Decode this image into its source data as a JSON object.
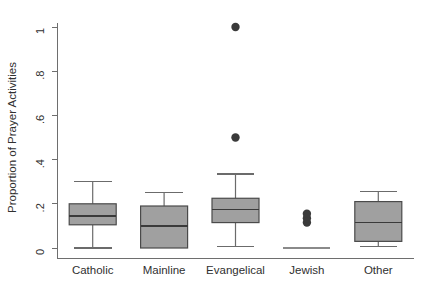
{
  "chart_data": {
    "type": "box",
    "title": "",
    "xlabel": "",
    "ylabel": "Proportion of Prayer Activities",
    "ylim": [
      0,
      1
    ],
    "grid": false,
    "legend": null,
    "ytick_labels": [
      "0",
      ".2",
      ".4",
      ".6",
      ".8",
      "1"
    ],
    "ytick_values": [
      0,
      0.2,
      0.4,
      0.6,
      0.8,
      1
    ],
    "categories": [
      "Catholic",
      "Mainline",
      "Evangelical",
      "Jewish",
      "Other"
    ],
    "boxes": [
      {
        "category": "Catholic",
        "whisker_low": 0.0,
        "q1": 0.105,
        "median": 0.145,
        "q3": 0.2,
        "whisker_high": 0.3,
        "outliers": []
      },
      {
        "category": "Mainline",
        "whisker_low": 0.0,
        "q1": 0.0,
        "median": 0.1,
        "q3": 0.19,
        "whisker_high": 0.25,
        "outliers": []
      },
      {
        "category": "Evangelical",
        "whisker_low": 0.005,
        "q1": 0.115,
        "median": 0.175,
        "q3": 0.225,
        "whisker_high": 0.335,
        "outliers": [
          0.5,
          1.0
        ]
      },
      {
        "category": "Jewish",
        "whisker_low": 0.0,
        "q1": 0.0,
        "median": 0.0,
        "q3": 0.0,
        "whisker_high": 0.0,
        "outliers": [
          0.115,
          0.135,
          0.155
        ]
      },
      {
        "category": "Other",
        "whisker_low": 0.005,
        "q1": 0.03,
        "median": 0.115,
        "q3": 0.21,
        "whisker_high": 0.255,
        "outliers": []
      }
    ]
  },
  "colors": {
    "box_fill": "#a0a0a0",
    "box_edge": "#4a4a4a",
    "median": "#3a3a3a",
    "whisker": "#6b6b6b",
    "outlier": "#3a3a3a",
    "axis": "#6e6e6e",
    "text": "#303030",
    "background": "#ffffff"
  }
}
